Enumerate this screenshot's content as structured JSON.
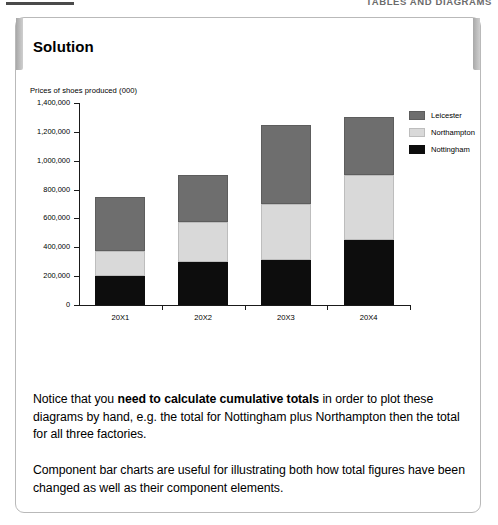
{
  "page_header": {
    "running_head": "TABLES AND DIAGRAMS"
  },
  "panel": {
    "heading": "Solution"
  },
  "chart_data": {
    "type": "bar",
    "subtype": "stacked",
    "title": "",
    "axis_label": "Prices of shoes produced (000)",
    "xlabel": "",
    "ylabel": "Prices of shoes produced (000)",
    "categories": [
      "20X1",
      "20X2",
      "20X3",
      "20X4"
    ],
    "ylim": [
      0,
      1400000
    ],
    "ytick_step": 200000,
    "ytick_labels": [
      "1,400,000",
      "1,200,000",
      "1,000,000",
      "800,000",
      "600,000",
      "400,000",
      "200,000",
      "0"
    ],
    "ytick_values": [
      1400000,
      1200000,
      1000000,
      800000,
      600000,
      400000,
      200000,
      0
    ],
    "grid": false,
    "legend_position": "top-right",
    "series": [
      {
        "name": "Nottingham",
        "color": "#0d0d0d",
        "values": [
          200000,
          300000,
          310000,
          450000
        ]
      },
      {
        "name": "Northampton",
        "color": "#d9d9d9",
        "values": [
          175000,
          275000,
          390000,
          450000
        ]
      },
      {
        "name": "Leicester",
        "color": "#6e6e6e",
        "values": [
          375000,
          325000,
          550000,
          400000
        ]
      }
    ],
    "cumulative_totals": [
      750000,
      900000,
      1250000,
      1300000
    ],
    "legend_order": [
      "Leicester",
      "Northampton",
      "Nottingham"
    ]
  },
  "body": {
    "paragraph_1": {
      "part_1": "Notice that you ",
      "bold": "need to calculate cumulative totals",
      "part_2": " in order to plot these diagrams by hand, e.g. the total for Nottingham plus Northampton then the total for all three factories."
    },
    "paragraph_2": "Component bar charts are useful for illustrating both how total figures have been changed as well as their component elements."
  }
}
